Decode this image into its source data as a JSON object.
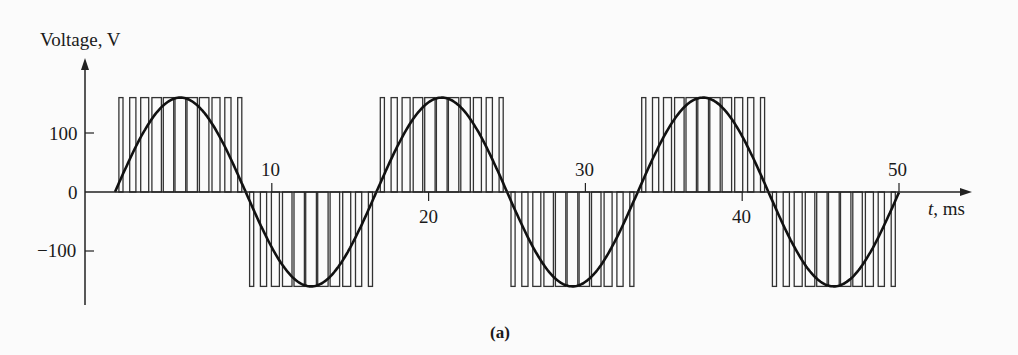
{
  "chart_data": {
    "type": "line",
    "title": "",
    "caption": "(a)",
    "ylabel": "Voltage, V",
    "xlabel_var": "t",
    "xlabel_unit": ", ms",
    "xlim": [
      0,
      50
    ],
    "ylim": [
      -200,
      200
    ],
    "x_ticks": [
      10,
      20,
      30,
      40,
      50
    ],
    "y_ticks": [
      100,
      0,
      -100
    ],
    "y_tick_labels": [
      "100",
      "0",
      "−100"
    ],
    "grid": false,
    "series": [
      {
        "name": "Sinusoidal reference (fundamental)",
        "kind": "sine",
        "amplitude_V": 160,
        "period_ms": 16.67,
        "frequency_Hz": 60,
        "x_range_ms": [
          0,
          50
        ]
      },
      {
        "name": "PWM output voltage",
        "kind": "pwm",
        "level_V": 160,
        "pulses_per_half_cycle": 11,
        "period_ms": 16.67,
        "x_range_ms": [
          0,
          50
        ]
      }
    ],
    "sample_points": {
      "x": [
        0,
        4.17,
        8.33,
        12.5,
        16.67,
        20.83,
        25,
        29.17,
        33.33,
        37.5,
        41.67,
        45.83,
        50
      ],
      "y": [
        0,
        160,
        0,
        -160,
        0,
        160,
        0,
        -160,
        0,
        160,
        0,
        -160,
        0
      ]
    }
  },
  "labels": {
    "y_axis_title": "Voltage, V",
    "x_axis_var": "t",
    "x_axis_unit": ", ms",
    "caption": "(a)",
    "x10": "10",
    "x20": "20",
    "x30": "30",
    "x40": "40",
    "x50": "50",
    "y100": "100",
    "y0": "0",
    "ym100": "−100"
  }
}
